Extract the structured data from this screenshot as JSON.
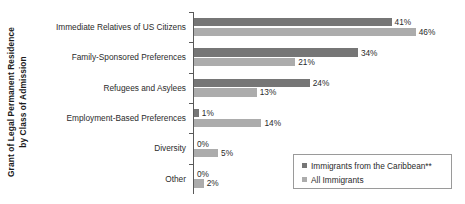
{
  "chart_data": {
    "type": "bar",
    "orientation": "horizontal",
    "title": "",
    "subtitle": "",
    "xlabel": "",
    "ylabel": "Grant of Legal Permanent Residence by Class of Admission",
    "ylabel_lines": [
      "Grant of Legal Permanent Residence",
      "by Class of Admission"
    ],
    "categories": [
      "Immediate Relatives of US Citizens",
      "Family-Sponsored Preferences",
      "Refugees and Asylees",
      "Employment-Based Preferences",
      "Diversity",
      "Other"
    ],
    "series": [
      {
        "name": "Immigrants from the Caribbean**",
        "color": "#767676",
        "values": [
          41,
          34,
          24,
          1,
          0,
          0
        ],
        "labels": [
          "41%",
          "34%",
          "24%",
          "1%",
          "0%",
          "0%"
        ]
      },
      {
        "name": "All Immigrants",
        "color": "#acacac",
        "values": [
          46,
          21,
          13,
          14,
          5,
          2
        ],
        "labels": [
          "46%",
          "21%",
          "13%",
          "14%",
          "5%",
          "2%"
        ]
      }
    ],
    "xlim": [
      0,
      50
    ],
    "grid": false,
    "legend_position": "bottom-right",
    "axis_color": "#595959",
    "background": "#ffffff"
  },
  "legend": {
    "items": [
      {
        "label": "Immigrants from the Caribbean**",
        "color": "#767676"
      },
      {
        "label": "All Immigrants",
        "color": "#acacac"
      }
    ]
  }
}
